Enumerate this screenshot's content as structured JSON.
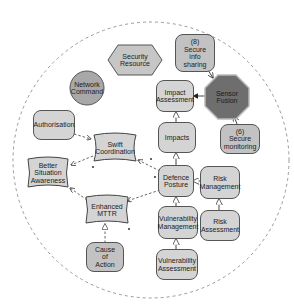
{
  "diagram": {
    "boundary": {
      "shape": "dashed-circle",
      "cx": 151,
      "cy": 160,
      "r": 138,
      "color": "#9a9a9a"
    },
    "colors": {
      "node_fill": "#d4d4d4",
      "node_fill_mid": "#c2c2c2",
      "node_fill_circle": "#a8a8a8",
      "sensor_fusion_fill": "#6e6e6e",
      "sensor_fusion_border": "#b9b9b9",
      "stroke": "#555555"
    },
    "nodes": [
      {
        "id": "security-resource",
        "label": "Security\nResource",
        "shape": "hexagon"
      },
      {
        "id": "secure-info-sharing",
        "label": "(8)\nSecure\ninfo\nsharing",
        "shape": "rounded-rect"
      },
      {
        "id": "network-command",
        "label": "Network\nCommand",
        "shape": "circle"
      },
      {
        "id": "impact-assessment",
        "label": "Impact\nAssessment",
        "shape": "rounded-rect"
      },
      {
        "id": "sensor-fusion",
        "label": "Sensor\nFusion",
        "shape": "octagon"
      },
      {
        "id": "authorisation",
        "label": "Authorisation",
        "shape": "rounded-rect"
      },
      {
        "id": "swift-coordination",
        "label": "Swift\nCoordination",
        "shape": "wavy-rect"
      },
      {
        "id": "impacts",
        "label": "Impacts",
        "shape": "rounded-rect"
      },
      {
        "id": "secure-monitoring",
        "label": "(6)\nSecure\nmonitoring",
        "shape": "rounded-rect"
      },
      {
        "id": "better-situation-awareness",
        "label": "Better\nSituation\nAwareness",
        "shape": "wavy-rect"
      },
      {
        "id": "defence-posture",
        "label": "Defence\nPosture",
        "shape": "rounded-rect"
      },
      {
        "id": "risk-management",
        "label": "Risk\nManagement",
        "shape": "rounded-rect"
      },
      {
        "id": "enhanced-mttr",
        "label": "Enhanced\nMTTR",
        "shape": "wavy-rect"
      },
      {
        "id": "vulnerability-management",
        "label": "Vulnerability\nManagement",
        "shape": "rounded-rect"
      },
      {
        "id": "risk-assessment",
        "label": "Risk\nAssessment",
        "shape": "rounded-rect"
      },
      {
        "id": "cause-of-action",
        "label": "Cause\nof\nAction",
        "shape": "rounded-rect"
      },
      {
        "id": "vulnerability-assessment",
        "label": "Vulnerability\nAssessment",
        "shape": "rounded-rect"
      }
    ],
    "edges": [
      {
        "from": "secure-info-sharing",
        "to": "sensor-fusion",
        "style": "solid",
        "arrow": "open"
      },
      {
        "from": "secure-monitoring",
        "to": "sensor-fusion",
        "style": "solid",
        "arrow": "open"
      },
      {
        "from": "sensor-fusion",
        "to": "impact-assessment",
        "style": "solid",
        "arrow": "filled"
      },
      {
        "from": "impacts",
        "to": "impact-assessment",
        "style": "solid",
        "arrow": "hollow-triangle"
      },
      {
        "from": "defence-posture",
        "to": "impacts",
        "style": "solid",
        "arrow": "hollow-triangle"
      },
      {
        "from": "risk-management",
        "to": "defence-posture",
        "style": "solid",
        "arrow": "hollow-triangle"
      },
      {
        "from": "vulnerability-management",
        "to": "defence-posture",
        "style": "solid",
        "arrow": "hollow-triangle"
      },
      {
        "from": "vulnerability-assessment",
        "to": "vulnerability-management",
        "style": "solid",
        "arrow": "hollow-triangle"
      },
      {
        "from": "risk-assessment",
        "to": "risk-management",
        "style": "solid",
        "arrow": "hollow-triangle"
      },
      {
        "from": "authorisation",
        "to": "swift-coordination",
        "style": "dashed",
        "arrow": "open"
      },
      {
        "from": "defence-posture",
        "to": "swift-coordination",
        "style": "dashed",
        "arrow": "open"
      },
      {
        "from": "swift-coordination",
        "to": "better-situation-awareness",
        "style": "dashed",
        "arrow": "open"
      },
      {
        "from": "enhanced-mttr",
        "to": "better-situation-awareness",
        "style": "dashed",
        "arrow": "open"
      },
      {
        "from": "defence-posture",
        "to": "enhanced-mttr",
        "style": "dashed",
        "arrow": "open"
      },
      {
        "from": "cause-of-action",
        "to": "enhanced-mttr",
        "style": "dashed",
        "arrow": "hollow-triangle"
      }
    ]
  }
}
